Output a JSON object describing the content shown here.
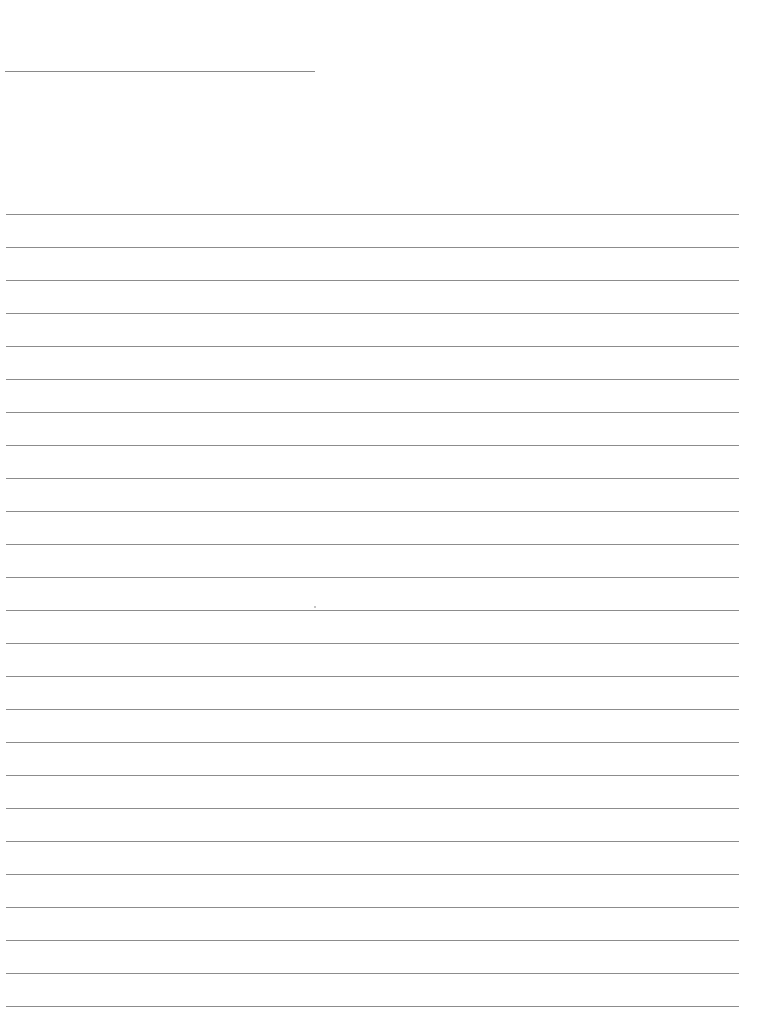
{
  "page": {
    "type": "lined-writing-paper",
    "background": "#ffffff",
    "line_color": "#8c8c8c",
    "title_line": {
      "x": 5,
      "y": 71,
      "width": 310
    },
    "ruled_lines": {
      "count": 25,
      "first_y": 214,
      "spacing": 33,
      "x_start": 6,
      "x_end": 739
    }
  }
}
